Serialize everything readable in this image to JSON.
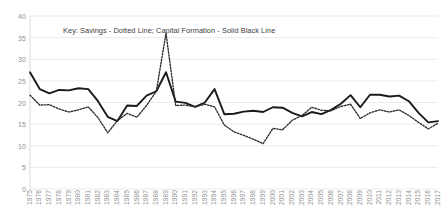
{
  "chart_data": {
    "type": "line",
    "title": "",
    "annotation": "Key: Savings - Dotted Line; Capital Formation - Solid Black Line",
    "xlabel": "",
    "ylabel": "",
    "ylim": [
      0,
      40
    ],
    "yticks": [
      0,
      5,
      10,
      15,
      20,
      25,
      30,
      35,
      40
    ],
    "grid": true,
    "legend_position": "inside-top-left-annotation",
    "categories": [
      "1975",
      "1976",
      "1977",
      "1978",
      "1979",
      "1980",
      "1981",
      "1982",
      "1983",
      "1984",
      "1985",
      "1986",
      "1987",
      "1988",
      "1989",
      "1990",
      "1991",
      "1992",
      "1993",
      "1994",
      "1995",
      "1996",
      "1997",
      "1998",
      "1999",
      "2000",
      "2001",
      "2002",
      "2003",
      "2004",
      "2005",
      "2006",
      "2007",
      "2008",
      "2009",
      "2010",
      "2011",
      "2012",
      "2013",
      "2014",
      "2015",
      "2016",
      "2017"
    ],
    "series": [
      {
        "name": "Capital Formation",
        "style": "solid",
        "color": "#1a1a1a",
        "values": [
          27.0,
          23.1,
          22.1,
          22.9,
          22.8,
          23.3,
          23.1,
          20.3,
          16.7,
          15.7,
          19.3,
          19.2,
          21.6,
          22.6,
          27.0,
          20.2,
          19.9,
          19.0,
          20.0,
          23.1,
          17.3,
          17.4,
          17.9,
          18.1,
          17.8,
          18.9,
          18.8,
          17.6,
          16.8,
          17.8,
          17.3,
          18.3,
          19.7,
          21.7,
          18.9,
          21.8,
          21.8,
          21.4,
          21.6,
          20.3,
          17.6,
          15.4,
          15.7
        ]
      },
      {
        "name": "Savings",
        "style": "dotted",
        "color": "#2b2b2b",
        "values": [
          21.7,
          19.4,
          19.5,
          18.5,
          17.8,
          18.3,
          19.0,
          16.5,
          13.0,
          15.8,
          17.5,
          16.6,
          19.3,
          22.6,
          36.0,
          19.3,
          19.4,
          19.0,
          19.6,
          19.0,
          14.8,
          13.2,
          12.4,
          11.5,
          10.5,
          14.0,
          13.7,
          15.9,
          17.0,
          18.9,
          18.2,
          18.1,
          19.1,
          19.6,
          16.3,
          17.6,
          18.3,
          17.8,
          18.3,
          17.0,
          15.4,
          13.9,
          15.2
        ]
      }
    ]
  }
}
